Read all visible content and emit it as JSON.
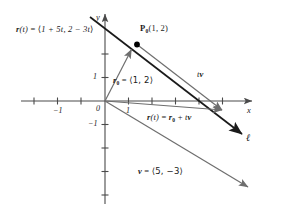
{
  "figure": {
    "title_caption": "",
    "colors": {
      "line_ell": "#1a1a1a",
      "vector_gray": "#6e6e6e",
      "axis": "#4a4a4a",
      "point": "#000000",
      "text": "#1a1a1a"
    },
    "axes": {
      "x_label": "x",
      "y_label": "y",
      "origin_label": "0",
      "x_ticks": [
        {
          "value": -2,
          "label": ""
        },
        {
          "value": -1,
          "label": "−1"
        },
        {
          "value": 1,
          "label": "1"
        },
        {
          "value": 2,
          "label": ""
        },
        {
          "value": 3,
          "label": ""
        },
        {
          "value": 4,
          "label": ""
        },
        {
          "value": 5,
          "label": ""
        },
        {
          "value": 6,
          "label": ""
        }
      ],
      "y_ticks": [
        {
          "value": 2,
          "label": ""
        },
        {
          "value": 1,
          "label": "1"
        },
        {
          "value": -1,
          "label": "−1"
        },
        {
          "value": -2,
          "label": ""
        },
        {
          "value": -3,
          "label": ""
        },
        {
          "value": -4,
          "label": ""
        }
      ],
      "x_range": [
        -3.6,
        6.2
      ],
      "y_range": [
        -4.2,
        3.8
      ]
    },
    "labels": {
      "parametric_vector": {
        "text": "r(t) = ⟨1 + 5t, 2 − 3t⟩",
        "parts": {
          "r": "r",
          "t_paren": "(t)",
          "eq": " = ",
          "open": "⟨",
          "comp_x": "1 + 5t",
          "comma": ", ",
          "comp_y": "2 − 3t",
          "close": "⟩"
        }
      },
      "point_p0": {
        "text": "P₀(1, 2)",
        "name": "P",
        "sub": "0",
        "coords": "(1, 2)"
      },
      "r_zero": {
        "text": "r₀ = ⟨1, 2⟩",
        "name": "r",
        "sub": "0",
        "eq": " = ",
        "value": "⟨1, 2⟩"
      },
      "tv": {
        "text": "tv",
        "scalar": "t",
        "vector": "v"
      },
      "vector_eq": {
        "text": "r(t) = r₀ + tv",
        "lhs_r": "r",
        "lhs_t": "(t)",
        "eq": " = ",
        "rhs_r": "r",
        "rhs_sub": "0",
        "plus": " + ",
        "rhs_t": "t",
        "rhs_v": "v"
      },
      "v_vector": {
        "text": "v = ⟨5, −3⟩",
        "name": "v",
        "eq": " = ",
        "value": "⟨5, −3⟩"
      },
      "line_name": "ℓ"
    },
    "geometry": {
      "origin_px": [
        105,
        101
      ],
      "unit_px": 23.5,
      "point_p0_value": [
        1,
        2
      ],
      "direction_vector": [
        5,
        -3
      ],
      "line_slope": -0.6
    }
  }
}
